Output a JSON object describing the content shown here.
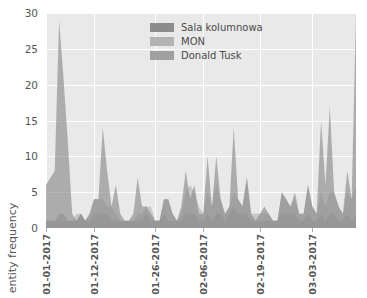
{
  "chart_data": {
    "type": "area",
    "title": "",
    "xlabel": "",
    "ylabel": "entity frequency",
    "ylim": [
      0,
      30
    ],
    "yticks": [
      0,
      5,
      10,
      15,
      20,
      25,
      30
    ],
    "grid": true,
    "legend_position": "upper center",
    "stacked": false,
    "alpha": 0.65,
    "x_tick_labels": [
      "01-01-2017",
      "01-12-2017",
      "01-26-2017",
      "02-06-2017",
      "02-19-2017",
      "03-03-2017"
    ],
    "x_tick_indices": [
      0,
      11,
      25,
      36,
      49,
      61
    ],
    "n_points": 72,
    "colors": {
      "sala_kolumnowa": "#8c8c8c",
      "mon": "#b3b3b3",
      "donald_tusk": "#a0a0a0",
      "background": "#e9e9e9",
      "gridline": "#ffffff",
      "text": "#555555"
    },
    "series": [
      {
        "name": "Sala kolumnowa",
        "color": "#8c8c8c",
        "values": [
          6,
          7,
          8,
          29,
          21,
          12,
          2,
          1,
          2,
          1,
          2,
          4,
          4,
          14,
          8,
          3,
          6,
          2,
          1,
          1,
          2,
          7,
          3,
          3,
          2,
          1,
          1,
          4,
          4,
          2,
          1,
          3,
          8,
          4,
          6,
          2,
          2,
          10,
          3,
          10,
          4,
          2,
          3,
          14,
          4,
          3,
          7,
          2,
          1,
          2,
          3,
          2,
          1,
          1,
          5,
          4,
          3,
          5,
          2,
          2,
          6,
          3,
          2,
          15,
          6,
          17,
          5,
          3,
          2,
          8,
          4,
          30
        ]
      },
      {
        "name": "MON",
        "color": "#b3b3b3",
        "values": [
          1,
          1,
          1,
          1,
          1,
          1,
          1,
          2,
          2,
          1,
          2,
          4,
          4,
          4,
          3,
          3,
          2,
          1,
          1,
          1,
          1,
          2,
          2,
          3,
          3,
          1,
          1,
          4,
          4,
          2,
          1,
          2,
          5,
          6,
          5,
          3,
          2,
          5,
          3,
          6,
          4,
          2,
          3,
          5,
          4,
          3,
          7,
          2,
          2,
          2,
          2,
          2,
          1,
          1,
          5,
          4,
          3,
          4,
          2,
          2,
          6,
          3,
          2,
          5,
          3,
          5,
          5,
          3,
          2,
          5,
          4,
          6
        ]
      },
      {
        "name": "Donald Tusk",
        "color": "#a0a0a0",
        "values": [
          1,
          1,
          1,
          2,
          2,
          1,
          1,
          1,
          2,
          1,
          1,
          2,
          2,
          2,
          2,
          1,
          1,
          1,
          1,
          1,
          1,
          1,
          1,
          2,
          1,
          1,
          1,
          2,
          1,
          1,
          1,
          1,
          2,
          2,
          2,
          1,
          1,
          2,
          1,
          2,
          2,
          1,
          2,
          3,
          2,
          2,
          2,
          1,
          1,
          1,
          1,
          1,
          1,
          1,
          2,
          2,
          2,
          2,
          1,
          1,
          2,
          1,
          1,
          2,
          1,
          2,
          2,
          1,
          1,
          2,
          1,
          2
        ]
      }
    ],
    "legend_entries": [
      {
        "label": "Sala kolumnowa",
        "color": "#8c8c8c"
      },
      {
        "label": "MON",
        "color": "#b3b3b3"
      },
      {
        "label": "Donald Tusk",
        "color": "#a0a0a0"
      }
    ]
  }
}
